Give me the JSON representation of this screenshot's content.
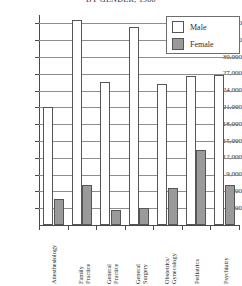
{
  "chart_data": {
    "type": "bar",
    "title": "BY GENDER, 1988",
    "xlabel": "",
    "ylabel": "",
    "ylim": [
      0,
      37500
    ],
    "ytick_values": [
      3000,
      6000,
      9000,
      12000,
      15000,
      18000,
      21000,
      24000,
      27000,
      30000,
      33000,
      36000
    ],
    "ytick_labels": [
      "3,000",
      "6,000",
      "9,000",
      "12,000",
      "15,000",
      "18,000",
      "21,000",
      "24,000",
      "27,000",
      "30,000",
      "33,000",
      "36,000"
    ],
    "grid": true,
    "legend_position": "top-right",
    "categories": [
      "Anesthesiology",
      "Family Practice",
      "General Practice",
      "General Surgery",
      "Obstetrics/ Gynecology",
      "Pediatrics",
      "Psychiatry"
    ],
    "category_lines": [
      [
        "Anesthesiology"
      ],
      [
        "Family",
        "Practice"
      ],
      [
        "General",
        "Practice"
      ],
      [
        "General",
        "Surgery"
      ],
      [
        "Obstetrics/",
        "Gynecology"
      ],
      [
        "Pediatrics"
      ],
      [
        "Psychiatry"
      ]
    ],
    "series": [
      {
        "name": "Male",
        "color": "#ffffff",
        "values": [
          21000,
          36600,
          25500,
          35400,
          25100,
          26600,
          26700
        ]
      },
      {
        "name": "Female",
        "color": "#9a9a9a",
        "values": [
          4600,
          7100,
          2700,
          3000,
          6600,
          13400,
          7100
        ]
      }
    ]
  },
  "legend": {
    "items": [
      {
        "label": "Male"
      },
      {
        "label": "Female"
      }
    ]
  }
}
